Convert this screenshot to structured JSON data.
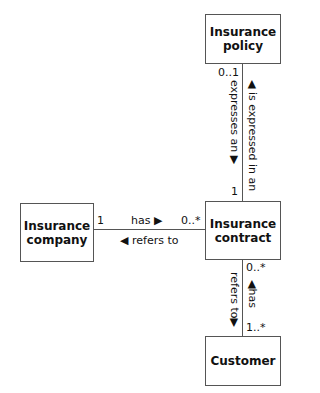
{
  "classes": {
    "policy": "Insurance\npolicy",
    "policy_l1": "Insurance",
    "policy_l2": "policy",
    "contract_l1": "Insurance",
    "contract_l2": "contract",
    "company_l1": "Insurance",
    "company_l2": "company",
    "customer": "Customer"
  },
  "associations": {
    "policy_contract": {
      "mult_policy": "0..1",
      "mult_contract": "1",
      "label_up": "◀ is expressed in an",
      "label_down": "expresses an ▶"
    },
    "company_contract": {
      "mult_company": "1",
      "mult_contract": "0..*",
      "label_forward": "has ▶",
      "label_backward": "◀ refers to"
    },
    "contract_customer": {
      "mult_contract": "0..*",
      "mult_customer": "1..*",
      "label_up": "◀has",
      "label_down": "refers to▶"
    }
  }
}
